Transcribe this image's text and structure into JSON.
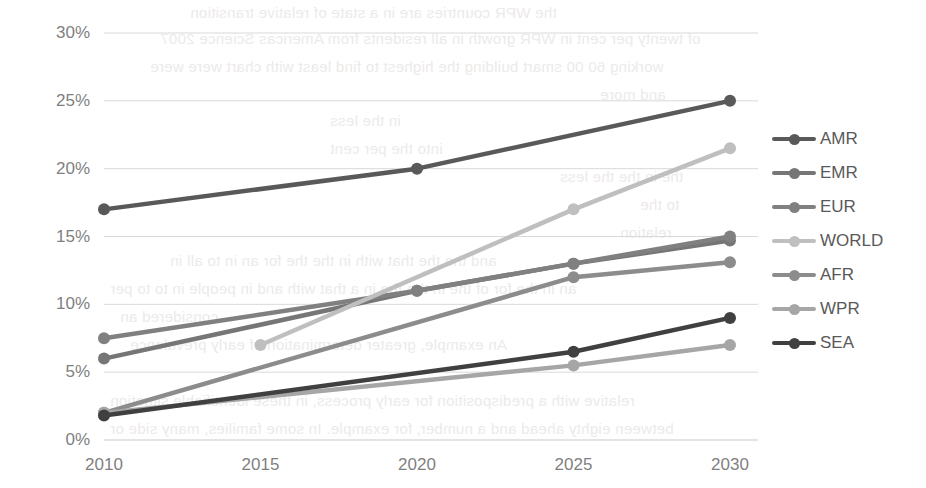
{
  "chart_data": {
    "type": "line",
    "title": "",
    "subtitle": "",
    "xlabel": "",
    "ylabel": "",
    "categories": [
      "2010",
      "2015",
      "2020",
      "2025",
      "2030"
    ],
    "x": [
      2010,
      2015,
      2020,
      2025,
      2030
    ],
    "ylim": [
      0,
      30
    ],
    "ytick_labels": [
      "0%",
      "5%",
      "10%",
      "15%",
      "20%",
      "25%",
      "30%"
    ],
    "ytick_values": [
      0,
      5,
      10,
      15,
      20,
      25,
      30
    ],
    "grid": "horizontal",
    "legend_position": "right",
    "markers": "circle",
    "series": [
      {
        "name": "AMR",
        "color": "#595959",
        "values": [
          17.0,
          null,
          20.0,
          null,
          25.0
        ]
      },
      {
        "name": "EMR",
        "color": "#767676",
        "values": [
          6.0,
          null,
          11.0,
          13.0,
          14.7
        ]
      },
      {
        "name": "EUR",
        "color": "#808080",
        "values": [
          7.5,
          null,
          11.0,
          13.0,
          15.0
        ]
      },
      {
        "name": "WORLD",
        "color": "#bfbfbf",
        "values": [
          null,
          7.0,
          null,
          17.0,
          21.5
        ]
      },
      {
        "name": "AFR",
        "color": "#8c8c8c",
        "values": [
          2.0,
          null,
          null,
          12.0,
          13.1
        ]
      },
      {
        "name": "WPR",
        "color": "#a6a6a6",
        "values": [
          2.0,
          null,
          null,
          5.5,
          7.0
        ]
      },
      {
        "name": "SEA",
        "color": "#404040",
        "values": [
          1.8,
          null,
          null,
          6.5,
          9.0
        ]
      }
    ]
  },
  "legend": {
    "items": [
      {
        "label": "AMR"
      },
      {
        "label": "EMR"
      },
      {
        "label": "EUR"
      },
      {
        "label": "WORLD"
      },
      {
        "label": "AFR"
      },
      {
        "label": "WPR"
      },
      {
        "label": "SEA"
      }
    ]
  },
  "background_text": {
    "lines": [
      "the WPR countries are in a state of relative transition",
      "of twenty per cent in WPR growth in all residents from Americas Science 2007",
      "working 60 00 smart building the highest to find least with chart were were",
      "and more",
      "in the less",
      "into the per cent",
      "the in the the less",
      "to the",
      "relation",
      "and the the that with in the the for an in to all in",
      "an in the for of the in the the in a that with and in people in to to per",
      "considered an",
      "An example, greater determination of early prevalence",
      "relative with a predisposition for early process, in these identifiable situation",
      "between eighty ahead and a number, for example. In some families, many side or"
    ]
  }
}
